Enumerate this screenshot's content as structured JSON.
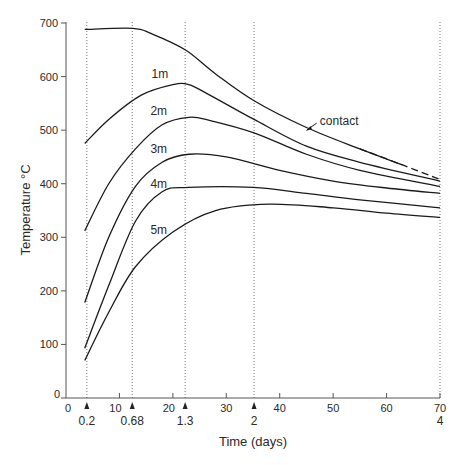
{
  "chart_data": {
    "type": "line",
    "title": "",
    "xlabel": "Time (days)",
    "ylabel": "Temperature °C",
    "xlim": [
      0,
      70
    ],
    "ylim": [
      0,
      700
    ],
    "grid": false,
    "legend": "inline labels",
    "x_ticks": [
      0,
      10,
      20,
      30,
      40,
      50,
      60,
      70
    ],
    "y_ticks": [
      0,
      100,
      200,
      300,
      400,
      500,
      600,
      700
    ],
    "secondary_x_markers": [
      {
        "x": 3.9,
        "label": "0.2"
      },
      {
        "x": 12.4,
        "label": "0.68"
      },
      {
        "x": 22.3,
        "label": "1.3"
      },
      {
        "x": 35.2,
        "label": "2"
      },
      {
        "x": 70,
        "label": "4"
      }
    ],
    "series": [
      {
        "name": "contact",
        "label_pos": [
          47.5,
          517
        ],
        "dashed_from_x": 58,
        "points": [
          [
            3.5,
            688
          ],
          [
            12.5,
            690
          ],
          [
            16,
            680
          ],
          [
            22.3,
            650
          ],
          [
            28,
            605
          ],
          [
            35.2,
            555
          ],
          [
            45,
            505
          ],
          [
            55,
            465
          ],
          [
            63,
            435
          ],
          [
            70,
            408
          ]
        ]
      },
      {
        "name": "1m",
        "label_pos": [
          16,
          597
        ],
        "points": [
          [
            3.5,
            475
          ],
          [
            8,
            520
          ],
          [
            14,
            565
          ],
          [
            20,
            585
          ],
          [
            23,
            585
          ],
          [
            27,
            565
          ],
          [
            35.2,
            520
          ],
          [
            45,
            470
          ],
          [
            55,
            440
          ],
          [
            70,
            405
          ]
        ]
      },
      {
        "name": "2m",
        "label_pos": [
          15.8,
          528
        ],
        "points": [
          [
            3.5,
            312
          ],
          [
            8,
            400
          ],
          [
            13,
            465
          ],
          [
            18,
            510
          ],
          [
            23,
            524
          ],
          [
            27,
            518
          ],
          [
            35.2,
            495
          ],
          [
            45,
            455
          ],
          [
            55,
            425
          ],
          [
            70,
            395
          ]
        ]
      },
      {
        "name": "3m",
        "label_pos": [
          15.8,
          458
        ],
        "points": [
          [
            3.5,
            178
          ],
          [
            8,
            300
          ],
          [
            13,
            395
          ],
          [
            18,
            440
          ],
          [
            23,
            455
          ],
          [
            30,
            450
          ],
          [
            40,
            425
          ],
          [
            50,
            405
          ],
          [
            60,
            392
          ],
          [
            70,
            382
          ]
        ]
      },
      {
        "name": "4m",
        "label_pos": [
          15.8,
          392
        ],
        "points": [
          [
            3.5,
            93
          ],
          [
            8,
            210
          ],
          [
            13,
            330
          ],
          [
            18,
            385
          ],
          [
            23,
            393
          ],
          [
            35,
            393
          ],
          [
            45,
            382
          ],
          [
            55,
            370
          ],
          [
            70,
            355
          ]
        ]
      },
      {
        "name": "5m",
        "label_pos": [
          15.8,
          306
        ],
        "points": [
          [
            3.5,
            70
          ],
          [
            8,
            160
          ],
          [
            13,
            245
          ],
          [
            20,
            310
          ],
          [
            28,
            350
          ],
          [
            38,
            362
          ],
          [
            50,
            355
          ],
          [
            60,
            345
          ],
          [
            70,
            337
          ]
        ]
      }
    ]
  }
}
